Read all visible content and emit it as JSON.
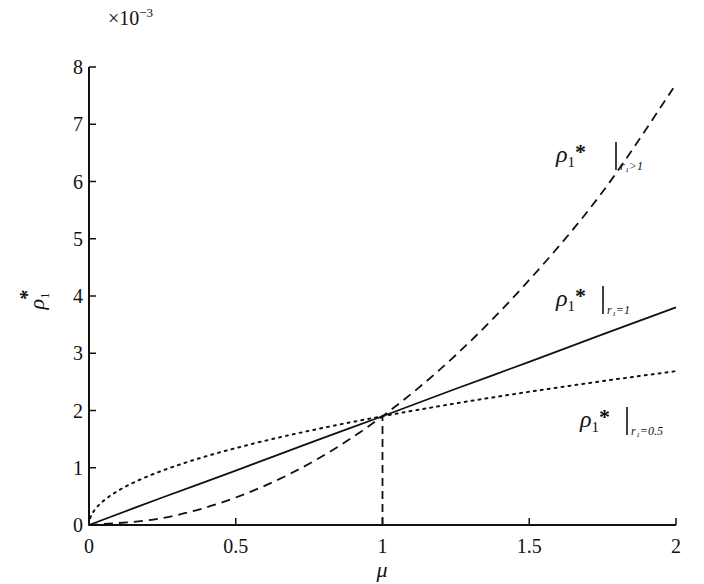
{
  "chart_data": {
    "type": "line",
    "title": "",
    "xlabel": "μ",
    "ylabel": "ρ1*",
    "y_scale_label": "×10⁻³",
    "y_multiplier": 0.001,
    "xlim": [
      0,
      2
    ],
    "ylim": [
      0,
      8
    ],
    "grid": false,
    "legend": "inline annotations",
    "x_ticks": [
      "0",
      "0.5",
      "1",
      "1.5",
      "2"
    ],
    "y_ticks": [
      "0",
      "1",
      "2",
      "3",
      "4",
      "5",
      "6",
      "7",
      "8"
    ],
    "x": [
      0,
      0.25,
      0.5,
      0.75,
      1.0,
      1.25,
      1.5,
      1.75,
      2.0
    ],
    "series": [
      {
        "name": "ρ1*|r1>1",
        "style": "dashed",
        "values": [
          0,
          0.12,
          0.48,
          1.07,
          1.9,
          2.97,
          4.28,
          5.82,
          7.7
        ]
      },
      {
        "name": "ρ1*|r1=1",
        "style": "solid",
        "values": [
          0,
          0.48,
          0.95,
          1.43,
          1.9,
          2.38,
          2.85,
          3.33,
          3.8
        ]
      },
      {
        "name": "ρ1*|r1=0.5",
        "style": "dotted",
        "values": [
          0,
          0.95,
          1.34,
          1.65,
          1.9,
          2.12,
          2.33,
          2.51,
          2.69
        ]
      }
    ],
    "annotations": [
      {
        "text_main": "ρ",
        "sub": "1",
        "star": "*",
        "cond": "r₁>1",
        "x": 1.78,
        "y": 6.3
      },
      {
        "text_main": "ρ",
        "sub": "1",
        "star": "*",
        "cond": "r₁=1",
        "x": 1.78,
        "y": 4.1
      },
      {
        "text_main": "ρ",
        "sub": "1",
        "star": "*",
        "cond": "r₁=0.5",
        "x": 1.81,
        "y": 1.6
      }
    ],
    "reference_line": {
      "x": 1,
      "y_from": 0,
      "y_to": 1.9,
      "style": "dashed"
    }
  },
  "labels": {
    "xlabel": "μ",
    "ylabel_main": "ρ",
    "ylabel_sub": "1",
    "ylabel_star": "*",
    "scale_times": "×10",
    "scale_exp": "−3",
    "ann1_main": "ρ",
    "ann1_sub": "1",
    "ann1_star": "*",
    "ann1_cond": "r₁>1",
    "ann2_main": "ρ",
    "ann2_sub": "1",
    "ann2_star": "*",
    "ann2_cond": "r₁=1",
    "ann3_main": "ρ",
    "ann3_sub": "1",
    "ann3_star": "*",
    "ann3_cond": "r₁=0.5"
  }
}
